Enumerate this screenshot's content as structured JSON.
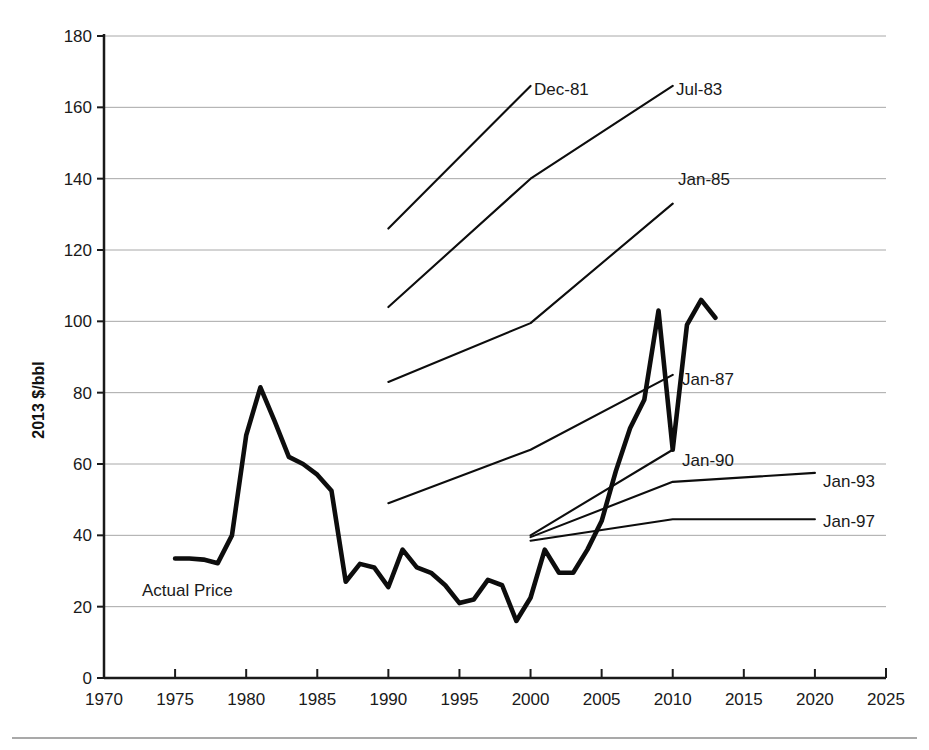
{
  "chart_data": {
    "type": "line",
    "title": "",
    "xlabel": "",
    "ylabel": "2013 $/bbl",
    "xlim": [
      1970,
      2025
    ],
    "ylim": [
      0,
      180
    ],
    "xticks": [
      1970,
      1975,
      1980,
      1985,
      1990,
      1995,
      2000,
      2005,
      2010,
      2015,
      2020,
      2025
    ],
    "yticks": [
      0,
      20,
      40,
      60,
      80,
      100,
      120,
      140,
      160,
      180
    ],
    "grid": "horizontal",
    "legend_position": "inline-annotations",
    "series": [
      {
        "name": "Actual Price",
        "style": "thick",
        "x": [
          1975,
          1976,
          1977,
          1978,
          1979,
          1980,
          1981,
          1982,
          1983,
          1984,
          1985,
          1986,
          1987,
          1988,
          1989,
          1990,
          1991,
          1992,
          1993,
          1994,
          1995,
          1996,
          1997,
          1998,
          1999,
          2000,
          2001,
          2002,
          2003,
          2004,
          2005,
          2006,
          2007,
          2008,
          2009,
          2010,
          2011,
          2012,
          2013
        ],
        "values": [
          33.5,
          33.5,
          33.2,
          32.2,
          40.0,
          68.0,
          81.5,
          72.0,
          62.0,
          60.0,
          57.0,
          52.5,
          27.0,
          32.0,
          31.0,
          25.5,
          36.0,
          31.0,
          29.5,
          26.0,
          21.0,
          22.0,
          27.5,
          26.0,
          16.0,
          22.5,
          36.0,
          29.5,
          29.5,
          36.0,
          44.0,
          58.0,
          70.0,
          78.0,
          103.0,
          64.0,
          99.0,
          106.0,
          101.0
        ]
      },
      {
        "name": "Dec-81",
        "style": "thin",
        "x": [
          1990,
          2000
        ],
        "values": [
          126,
          166
        ]
      },
      {
        "name": "Jul-83",
        "style": "thin",
        "x": [
          1990,
          2000,
          2010
        ],
        "values": [
          104,
          140,
          166
        ]
      },
      {
        "name": "Jan-85",
        "style": "thin",
        "x": [
          1990,
          2000,
          2010
        ],
        "values": [
          83,
          99.5,
          133
        ]
      },
      {
        "name": "Jan-87",
        "style": "thin",
        "x": [
          1990,
          2000,
          2010
        ],
        "values": [
          49,
          64,
          85
        ]
      },
      {
        "name": "Jan-90",
        "style": "thin",
        "x": [
          2000,
          2010
        ],
        "values": [
          40,
          64
        ]
      },
      {
        "name": "Jan-93",
        "style": "thin",
        "x": [
          2000,
          2010,
          2020
        ],
        "values": [
          39.5,
          55,
          57.5
        ]
      },
      {
        "name": "Jan-97",
        "style": "thin",
        "x": [
          2000,
          2010,
          2020
        ],
        "values": [
          38.5,
          44.5,
          44.5
        ]
      }
    ],
    "annotations": [
      {
        "text": "Dec-81",
        "x_px": 534,
        "y_px": 95,
        "anchor": "start"
      },
      {
        "text": "Jul-83",
        "x_px": 676,
        "y_px": 95,
        "anchor": "start"
      },
      {
        "text": "Jan-85",
        "x_px": 678,
        "y_px": 185,
        "anchor": "start"
      },
      {
        "text": "Jan-87",
        "x_px": 682,
        "y_px": 385,
        "anchor": "start"
      },
      {
        "text": "Jan-90",
        "x_px": 682,
        "y_px": 466,
        "anchor": "start"
      },
      {
        "text": "Jan-93",
        "x_px": 823,
        "y_px": 487,
        "anchor": "start"
      },
      {
        "text": "Jan-97",
        "x_px": 823,
        "y_px": 527,
        "anchor": "start"
      },
      {
        "text": "Actual Price",
        "x_px": 142,
        "y_px": 596,
        "anchor": "start"
      }
    ]
  },
  "axis": {
    "y_title": "2013 $/bbl",
    "y_tick_labels": [
      "180",
      "160",
      "140",
      "120",
      "100",
      "80",
      "60",
      "40",
      "20",
      "0"
    ],
    "x_tick_labels": [
      "1970",
      "1975",
      "1980",
      "1985",
      "1990",
      "1995",
      "2000",
      "2005",
      "2010",
      "2015",
      "2020",
      "2025"
    ]
  },
  "labels": {
    "actual_price": "Actual Price",
    "dec_81": "Dec-81",
    "jul_83": "Jul-83",
    "jan_85": "Jan-85",
    "jan_87": "Jan-87",
    "jan_90": "Jan-90",
    "jan_93": "Jan-93",
    "jan_97": "Jan-97"
  },
  "colors": {
    "ink": "#0d0d0d",
    "grid": "#a8a8a8",
    "background": "#ffffff",
    "footer_rule": "#8c8c8c"
  }
}
